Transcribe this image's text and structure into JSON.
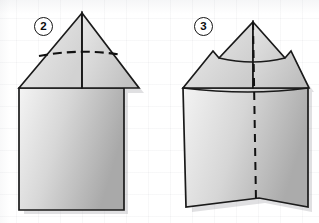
{
  "diagram": {
    "background_color": "#ffffff",
    "grid_color": "#787d87",
    "steps": [
      {
        "number": "2",
        "badge_label": "2",
        "caption": "",
        "shape": "house-pentagon-with-triangular-flap",
        "fold_lines": [
          {
            "name": "horizontal-valley-fold",
            "style": "dashed",
            "orientation": "horizontal-curved"
          },
          {
            "name": "center-crease",
            "style": "solid",
            "orientation": "vertical"
          }
        ],
        "paper_fill_light": "#f2f2f2",
        "paper_fill_dark": "#b4b4b4",
        "outline_color": "#1a1a1a"
      },
      {
        "number": "3",
        "badge_label": "3",
        "caption": "",
        "shape": "house-pentagon-with-folded-notched-flaps",
        "fold_lines": [
          {
            "name": "center-vertical-fold",
            "style": "dashed",
            "orientation": "vertical"
          },
          {
            "name": "flap-edge-crease",
            "style": "solid",
            "orientation": "horizontal-curved"
          }
        ],
        "notches": 2,
        "paper_fill_light": "#f2f2f2",
        "paper_fill_dark": "#b4b4b4",
        "outline_color": "#1a1a1a"
      }
    ]
  }
}
